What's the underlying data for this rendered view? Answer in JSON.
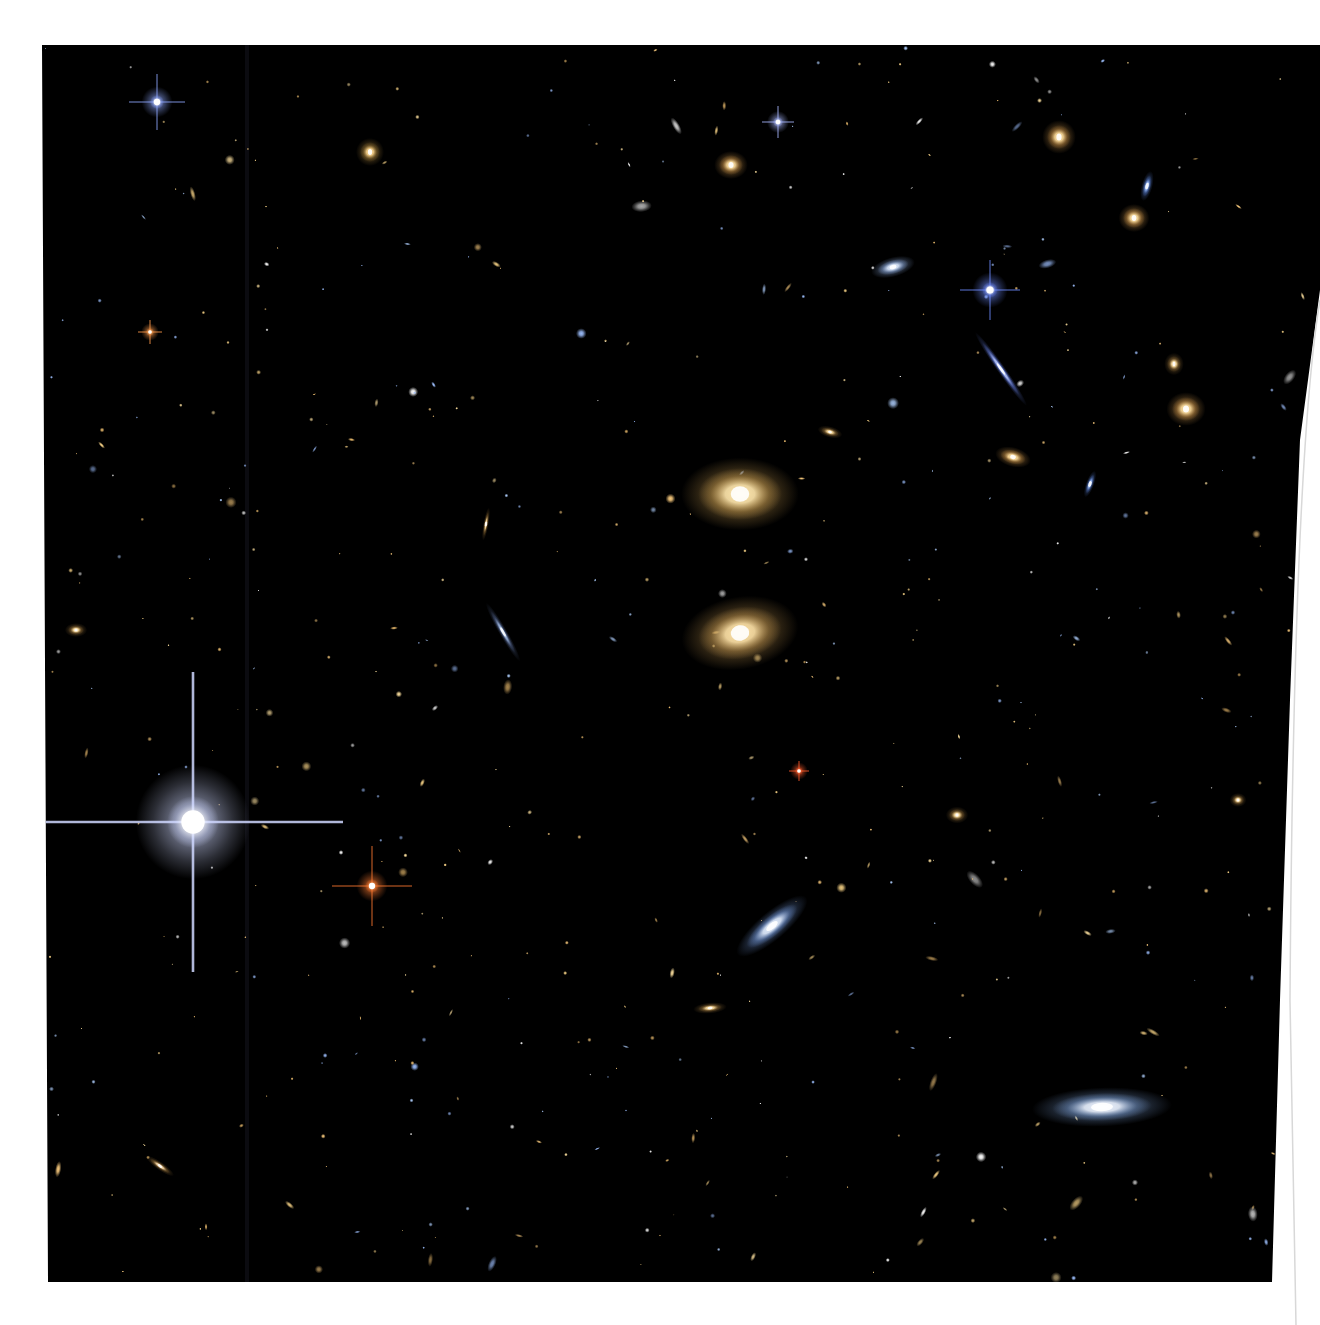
{
  "image": {
    "subject": "deep field galaxy cluster",
    "background_color": "#000000",
    "paper_color": "#ffffff",
    "frame": {
      "left": 42,
      "top": 45,
      "right_top": 1320,
      "right_bottom": 1272,
      "bottom": 1282
    },
    "seam_x": 247
  },
  "stars_spiked": [
    {
      "x": 193,
      "y": 822,
      "r": 26,
      "spike": 150,
      "color": "#ffffff",
      "glow": "#cfd8ff"
    },
    {
      "x": 372,
      "y": 886,
      "r": 7,
      "spike": 40,
      "color": "#ffb070",
      "glow": "#ff7a30"
    },
    {
      "x": 157,
      "y": 102,
      "r": 7,
      "spike": 28,
      "color": "#ffffff",
      "glow": "#8fa8ff"
    },
    {
      "x": 990,
      "y": 290,
      "r": 8,
      "spike": 30,
      "color": "#ffffff",
      "glow": "#6f8cff"
    },
    {
      "x": 778,
      "y": 122,
      "r": 5,
      "spike": 16,
      "color": "#ffffff",
      "glow": "#a9b8ff"
    },
    {
      "x": 150,
      "y": 332,
      "r": 4,
      "spike": 12,
      "color": "#ffc080",
      "glow": "#ff9a4a"
    },
    {
      "x": 799,
      "y": 771,
      "r": 4,
      "spike": 10,
      "color": "#ff9a6a",
      "glow": "#ff5a2a"
    }
  ],
  "galaxies": [
    {
      "x": 740,
      "y": 494,
      "rx": 42,
      "ry": 26,
      "rot": 0,
      "color": "#ffe8b0",
      "halo": "#b8904a"
    },
    {
      "x": 740,
      "y": 633,
      "rx": 42,
      "ry": 26,
      "rot": -10,
      "color": "#ffe4aa",
      "halo": "#b08848"
    },
    {
      "x": 1102,
      "y": 1107,
      "rx": 50,
      "ry": 14,
      "rot": -2,
      "color": "#eef4ff",
      "halo": "#6f8fbf"
    },
    {
      "x": 772,
      "y": 926,
      "rx": 32,
      "ry": 10,
      "rot": -40,
      "color": "#e6f0ff",
      "halo": "#6a8cc8"
    },
    {
      "x": 1001,
      "y": 369,
      "rx": 32,
      "ry": 3,
      "rot": 55,
      "color": "#b8c8ff",
      "halo": "#5a70c8"
    },
    {
      "x": 893,
      "y": 267,
      "rx": 16,
      "ry": 7,
      "rot": -15,
      "color": "#e0ecff",
      "halo": "#7f9ac8"
    },
    {
      "x": 1186,
      "y": 409,
      "rx": 14,
      "ry": 12,
      "rot": 0,
      "color": "#ffe0a0",
      "halo": "#b08040"
    },
    {
      "x": 1134,
      "y": 218,
      "rx": 11,
      "ry": 10,
      "rot": 0,
      "color": "#ffe0a0",
      "halo": "#b08040"
    },
    {
      "x": 1059,
      "y": 137,
      "rx": 12,
      "ry": 12,
      "rot": 0,
      "color": "#ffe0a0",
      "halo": "#a87a3c"
    },
    {
      "x": 731,
      "y": 165,
      "rx": 12,
      "ry": 10,
      "rot": 0,
      "color": "#ffe0a0",
      "halo": "#a87a3c"
    },
    {
      "x": 1013,
      "y": 457,
      "rx": 13,
      "ry": 7,
      "rot": 15,
      "color": "#ffe0a0",
      "halo": "#a87a3c"
    },
    {
      "x": 370,
      "y": 152,
      "rx": 10,
      "ry": 10,
      "rot": 0,
      "color": "#ffd890",
      "halo": "#8a6a30"
    },
    {
      "x": 1147,
      "y": 186,
      "rx": 4,
      "ry": 11,
      "rot": 15,
      "color": "#9fc0ff",
      "halo": "#4a6ab0"
    },
    {
      "x": 503,
      "y": 632,
      "rx": 24,
      "ry": 3,
      "rot": 60,
      "color": "#9fb8e0",
      "halo": "#4a5a80"
    },
    {
      "x": 710,
      "y": 1008,
      "rx": 12,
      "ry": 4,
      "rot": -5,
      "color": "#ffe0a0",
      "halo": "#806030"
    },
    {
      "x": 1174,
      "y": 364,
      "rx": 7,
      "ry": 8,
      "rot": 0,
      "color": "#ffe0a0",
      "halo": "#806030"
    },
    {
      "x": 76,
      "y": 630,
      "rx": 8,
      "ry": 5,
      "rot": 0,
      "color": "#ffe0a0",
      "halo": "#806030"
    },
    {
      "x": 160,
      "y": 1166,
      "rx": 12,
      "ry": 3,
      "rot": 35,
      "color": "#ffe0b0",
      "halo": "#806030"
    },
    {
      "x": 486,
      "y": 524,
      "rx": 12,
      "ry": 2,
      "rot": -80,
      "color": "#ffe0a0",
      "halo": "#806030"
    },
    {
      "x": 830,
      "y": 432,
      "rx": 9,
      "ry": 4,
      "rot": 15,
      "color": "#ffe0a0",
      "halo": "#806030"
    },
    {
      "x": 957,
      "y": 815,
      "rx": 8,
      "ry": 6,
      "rot": 0,
      "color": "#ffe0a0",
      "halo": "#806030"
    },
    {
      "x": 1090,
      "y": 484,
      "rx": 3,
      "ry": 10,
      "rot": 20,
      "color": "#9fc0ff",
      "halo": "#4a6ab0"
    },
    {
      "x": 1238,
      "y": 800,
      "rx": 6,
      "ry": 5,
      "rot": 0,
      "color": "#ffe0a0",
      "halo": "#806030"
    }
  ],
  "field_seed": 1337,
  "field_count": 520
}
